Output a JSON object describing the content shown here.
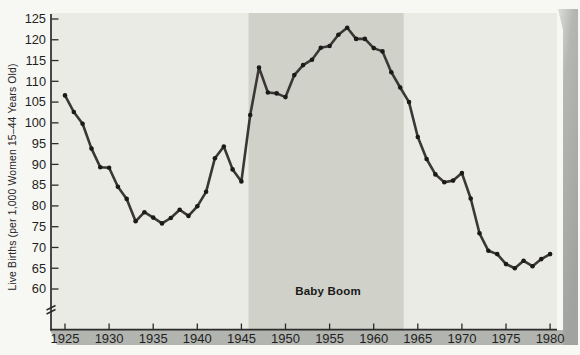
{
  "chart_data": {
    "type": "line",
    "title": "",
    "xlabel": "",
    "ylabel": "Live Births (per 1,000 Women 15–44 Years Old)",
    "series_name": "U.S. live births per 1,000 women 15–44 years old",
    "x": [
      1925,
      1926,
      1927,
      1928,
      1929,
      1930,
      1931,
      1932,
      1933,
      1934,
      1935,
      1936,
      1937,
      1938,
      1939,
      1940,
      1941,
      1942,
      1943,
      1944,
      1945,
      1946,
      1947,
      1948,
      1949,
      1950,
      1951,
      1952,
      1953,
      1954,
      1955,
      1956,
      1957,
      1958,
      1959,
      1960,
      1961,
      1962,
      1963,
      1964,
      1965,
      1966,
      1967,
      1968,
      1969,
      1970,
      1971,
      1972,
      1973,
      1974,
      1975,
      1976,
      1977,
      1978,
      1979,
      1980
    ],
    "values": [
      106.6,
      102.6,
      99.8,
      93.8,
      89.3,
      89.2,
      84.6,
      81.7,
      76.3,
      78.5,
      77.2,
      75.8,
      77.1,
      79.1,
      77.6,
      79.9,
      83.4,
      91.5,
      94.3,
      88.8,
      85.9,
      101.9,
      113.3,
      107.3,
      107.1,
      106.2,
      111.5,
      113.9,
      115.2,
      118.1,
      118.5,
      121.2,
      122.9,
      120.2,
      120.2,
      118.0,
      117.2,
      112.2,
      108.5,
      105.0,
      96.6,
      91.3,
      87.6,
      85.7,
      86.1,
      87.9,
      81.8,
      73.4,
      69.2,
      68.4,
      66.0,
      65.0,
      66.8,
      65.5,
      67.2,
      68.4
    ],
    "xticks": [
      "1925",
      "1930",
      "1935",
      "1940",
      "1945",
      "1950",
      "1955",
      "1960",
      "1965",
      "1970",
      "1975",
      "1980"
    ],
    "yticks": [
      "60",
      "65",
      "70",
      "75",
      "80",
      "85",
      "90",
      "95",
      "100",
      "105",
      "110",
      "115",
      "120",
      "125"
    ],
    "xlim": [
      1925,
      1980
    ],
    "ylim": [
      60,
      125
    ],
    "grid": false,
    "legend": "none",
    "axis_break": true,
    "marker": "dot",
    "shaded_region": {
      "label": "Baby Boom",
      "from_year": 1946,
      "to_year": 1964
    },
    "colors": {
      "line": "#3a3734",
      "marker": "#1c1a19",
      "axis": "#2b2b2b",
      "tick_text": "#1f1f1f",
      "plot_bg": "#eaebe5",
      "band_bg": "#d0d2c9",
      "bottom_band": "#b2b4b0",
      "page_bg": "#f7f7f4",
      "page_edge": "#a2a5a1"
    }
  }
}
